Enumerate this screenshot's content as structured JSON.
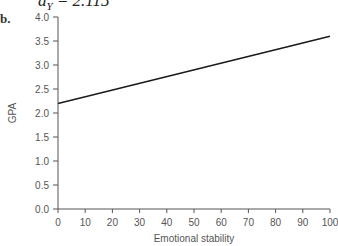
{
  "header": {
    "formula_var": "a",
    "formula_sub": "Y",
    "formula_rest": " = 2.115",
    "panel_label": "b."
  },
  "chart_data": {
    "type": "line",
    "title": "",
    "xlabel": "Emotional stability",
    "ylabel": "GPA",
    "xlim": [
      0,
      100
    ],
    "ylim": [
      0,
      4.0
    ],
    "x_ticks": [
      0,
      10,
      20,
      30,
      40,
      50,
      60,
      70,
      80,
      90,
      100
    ],
    "y_ticks": [
      "0.0",
      "0.5",
      "1.0",
      "1.5",
      "2.0",
      "2.5",
      "3.0",
      "3.5",
      "4.0"
    ],
    "grid": false,
    "legend": null,
    "series": [
      {
        "name": "regression line",
        "x": [
          0,
          100
        ],
        "values": [
          2.2,
          3.6
        ],
        "color": "#1a1a1a"
      }
    ]
  }
}
